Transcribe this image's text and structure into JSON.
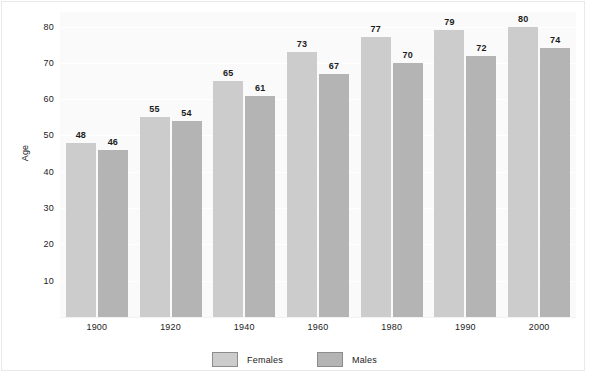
{
  "chart_data": {
    "type": "bar",
    "title": "",
    "subtitle": "",
    "xlabel": "",
    "ylabel": "Age",
    "categories": [
      "1900",
      "1920",
      "1940",
      "1960",
      "1980",
      "1990",
      "2000"
    ],
    "series": [
      {
        "name": "Females",
        "color": "#cccccc",
        "values": [
          48,
          55,
          65,
          73,
          77,
          79,
          80
        ]
      },
      {
        "name": "Males",
        "color": "#b4b4b4",
        "values": [
          46,
          54,
          61,
          67,
          70,
          72,
          74
        ]
      }
    ],
    "ylim": [
      0,
      84
    ],
    "yticks": [
      10,
      20,
      30,
      40,
      50,
      60,
      70,
      80
    ],
    "grid": true,
    "grid_axis": "y",
    "legend_position": "bottom",
    "data_labels": true,
    "plot_background": "#fafafa",
    "figure_background": "#ffffff"
  },
  "legend": {
    "items": [
      {
        "label": "Females",
        "color": "#cccccc"
      },
      {
        "label": "Males",
        "color": "#b4b4b4"
      }
    ]
  }
}
